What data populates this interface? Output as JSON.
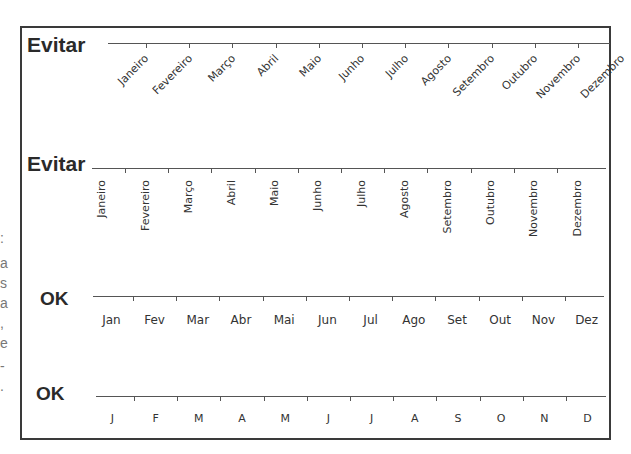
{
  "rows": [
    {
      "label": "Evitar",
      "style": "rotated-45",
      "months": [
        "Janeiro",
        "Fevereiro",
        "Março",
        "Abril",
        "Maio",
        "Junho",
        "Julho",
        "Agosto",
        "Setembro",
        "Outubro",
        "Novembro",
        "Dezembro"
      ]
    },
    {
      "label": "Evitar",
      "style": "rotated-90",
      "months": [
        "Janeiro",
        "Fevereiro",
        "Março",
        "Abril",
        "Maio",
        "Junho",
        "Julho",
        "Agosto",
        "Setembro",
        "Outubro",
        "Novembro",
        "Dezembro"
      ]
    },
    {
      "label": "OK",
      "style": "abbreviated",
      "months": [
        "Jan",
        "Fev",
        "Mar",
        "Abr",
        "Mai",
        "Jun",
        "Jul",
        "Ago",
        "Set",
        "Out",
        "Nov",
        "Dez"
      ]
    },
    {
      "label": "OK",
      "style": "single-letter",
      "months": [
        "J",
        "F",
        "M",
        "A",
        "M",
        "J",
        "J",
        "A",
        "S",
        "O",
        "N",
        "D"
      ]
    }
  ],
  "left_edge_fragments": [
    ":",
    "a",
    "s",
    "a",
    ",",
    "e",
    "-",
    "."
  ]
}
